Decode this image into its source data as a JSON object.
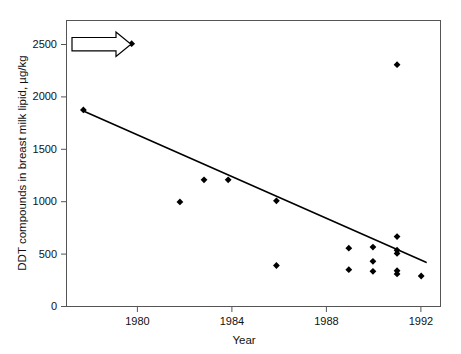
{
  "chart_data": {
    "type": "scatter",
    "title": "",
    "xlabel": "Year",
    "ylabel": "DDT compounds in breast milk lipid, µg/kg",
    "xlim": [
      1977.3,
      1992.8
    ],
    "ylim": [
      0,
      2720
    ],
    "xticks": [
      1980,
      1984,
      1988,
      1992
    ],
    "xtick_labels": [
      "1980",
      "1984",
      "1988",
      "1992"
    ],
    "yticks": [
      0,
      500,
      1000,
      1500,
      2000,
      2500
    ],
    "ytick_labels": [
      "0",
      "500",
      "1000",
      "1500",
      "2000",
      "2500"
    ],
    "grid": false,
    "legend": false,
    "series": [
      {
        "name": "DDT in breast milk lipid",
        "marker": "filled-diamond",
        "color": "#000000",
        "points": [
          {
            "x": 1978.0,
            "y": 1870
          },
          {
            "x": 1980.0,
            "y": 2500
          },
          {
            "x": 1982.0,
            "y": 995
          },
          {
            "x": 1983.0,
            "y": 1205
          },
          {
            "x": 1984.0,
            "y": 1205
          },
          {
            "x": 1986.0,
            "y": 1005
          },
          {
            "x": 1986.0,
            "y": 390
          },
          {
            "x": 1989.0,
            "y": 555
          },
          {
            "x": 1989.0,
            "y": 350
          },
          {
            "x": 1990.0,
            "y": 565
          },
          {
            "x": 1990.0,
            "y": 430
          },
          {
            "x": 1990.0,
            "y": 335
          },
          {
            "x": 1991.0,
            "y": 2300
          },
          {
            "x": 1991.0,
            "y": 665
          },
          {
            "x": 1991.0,
            "y": 535
          },
          {
            "x": 1991.0,
            "y": 505
          },
          {
            "x": 1991.0,
            "y": 340
          },
          {
            "x": 1991.0,
            "y": 310
          },
          {
            "x": 1992.0,
            "y": 290
          }
        ]
      }
    ],
    "trend_line": {
      "name": "fitted regression line",
      "color": "#000000",
      "start": {
        "x": 1978.0,
        "y": 1860
      },
      "end": {
        "x": 1992.2,
        "y": 420
      }
    },
    "annotations": [
      {
        "type": "arrow",
        "name": "outlier-callout-arrow",
        "direction": "right",
        "style": "hollow-outline",
        "points_to": {
          "x": 1980.0,
          "y": 2500
        },
        "label": ""
      }
    ]
  }
}
